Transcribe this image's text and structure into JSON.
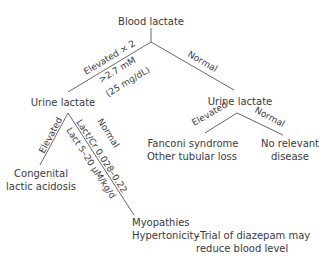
{
  "diagram": {
    "root": "Blood lactate",
    "edges": {
      "elevated_x2": "Elevated × 2",
      "threshold_mm": ">2.7 mM",
      "threshold_mgdl": "(25 mg/dL)",
      "normal_top": "Normal",
      "left_elevated": "Elevated",
      "left_normal": "Normal",
      "ratio": "Lact/Cr 0.028–0.22",
      "excretion": "Lact 5–20 µM/kg/d",
      "right_elevated": "Elevated",
      "right_normal": "Normal"
    },
    "nodes": {
      "urine_left": "Urine lactate",
      "urine_right": "Urine lactate",
      "congenital_1": "Congenital",
      "congenital_2": "lactic acidosis",
      "fanconi_1": "Fanconi syndrome",
      "fanconi_2": "Other tubular loss",
      "no_disease_1": "No relevant",
      "no_disease_2": "disease",
      "myopathies": "Myopathies",
      "hypertonicity": "Hypertonicity",
      "diazepam_1": "–Trial of diazepam may",
      "diazepam_2": "reduce blood level"
    },
    "line_color": "#555555"
  }
}
